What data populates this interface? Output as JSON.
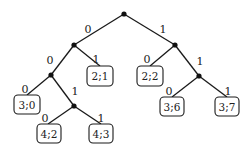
{
  "diagram": {
    "type": "binary-tree",
    "internal_nodes": [
      {
        "id": "root",
        "x": 124,
        "y": 14
      },
      {
        "id": "n0",
        "x": 74,
        "y": 45
      },
      {
        "id": "n1",
        "x": 175,
        "y": 45
      },
      {
        "id": "n00",
        "x": 51,
        "y": 75
      },
      {
        "id": "n001",
        "x": 74,
        "y": 106
      },
      {
        "id": "n11",
        "x": 199,
        "y": 76
      }
    ],
    "edges": [
      {
        "from": [
          124,
          14
        ],
        "to": [
          74,
          45
        ],
        "label": "0",
        "lx": 88,
        "ly": 33
      },
      {
        "from": [
          124,
          14
        ],
        "to": [
          175,
          45
        ],
        "label": "1",
        "lx": 163,
        "ly": 33
      },
      {
        "from": [
          74,
          45
        ],
        "to": [
          51,
          75
        ],
        "label": "0",
        "lx": 50,
        "ly": 64
      },
      {
        "from": [
          74,
          45
        ],
        "to": [
          100,
          66
        ],
        "label": "1",
        "lx": 96,
        "ly": 63
      },
      {
        "from": [
          175,
          45
        ],
        "to": [
          150,
          66
        ],
        "label": "0",
        "lx": 147,
        "ly": 63
      },
      {
        "from": [
          175,
          45
        ],
        "to": [
          199,
          76
        ],
        "label": "1",
        "lx": 200,
        "ly": 65
      },
      {
        "from": [
          51,
          75
        ],
        "to": [
          27,
          95
        ],
        "label": "0",
        "lx": 25,
        "ly": 93
      },
      {
        "from": [
          51,
          75
        ],
        "to": [
          74,
          106
        ],
        "label": "1",
        "lx": 75,
        "ly": 95
      },
      {
        "from": [
          74,
          106
        ],
        "to": [
          48,
          124
        ],
        "label": "0",
        "lx": 45,
        "ly": 122
      },
      {
        "from": [
          74,
          106
        ],
        "to": [
          101,
          124
        ],
        "label": "1",
        "lx": 101,
        "ly": 122
      },
      {
        "from": [
          199,
          76
        ],
        "to": [
          172,
          97
        ],
        "label": "0",
        "lx": 169,
        "ly": 95
      },
      {
        "from": [
          199,
          76
        ],
        "to": [
          227,
          97
        ],
        "label": "1",
        "lx": 228,
        "ly": 95
      }
    ],
    "leaves": [
      {
        "label": "2;1",
        "x": 87,
        "y": 66,
        "w": 26,
        "h": 20
      },
      {
        "label": "2;2",
        "x": 137,
        "y": 66,
        "w": 26,
        "h": 20
      },
      {
        "label": "3;0",
        "x": 14,
        "y": 95,
        "w": 26,
        "h": 19
      },
      {
        "label": "4;2",
        "x": 37,
        "y": 124,
        "w": 24,
        "h": 19
      },
      {
        "label": "4;3",
        "x": 89,
        "y": 124,
        "w": 24,
        "h": 19
      },
      {
        "label": "3;6",
        "x": 160,
        "y": 97,
        "w": 24,
        "h": 19
      },
      {
        "label": "3;7",
        "x": 215,
        "y": 97,
        "w": 24,
        "h": 19
      }
    ]
  }
}
